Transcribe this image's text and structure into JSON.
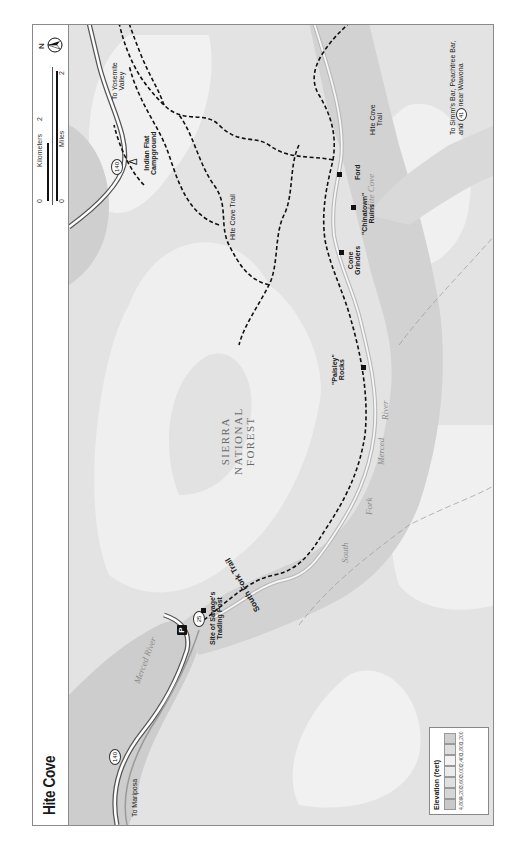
{
  "title": "Hite Cove",
  "orientation": "rotated 90° counter-clockwise",
  "scale": {
    "kilometers_label": "Kilometers",
    "km_start": "0",
    "km_end": "2",
    "miles_label": "Miles",
    "mi_start": "0",
    "mi_end": "2"
  },
  "north_label": "N",
  "legend": {
    "title": "Elevation (feet)",
    "values": [
      "4,800",
      "4,200",
      "3,600",
      "3,000",
      "2,400",
      "1,800",
      "1,200"
    ],
    "colors": [
      "#c9c9c9",
      "#d6d6d6",
      "#e0e0e0",
      "#ebebeb",
      "#f2f2f2",
      "#dedede",
      "#cfcfcf"
    ]
  },
  "labels": {
    "forest": "SIERRA NATIONAL FOREST",
    "forest_line1": "SIERRA",
    "forest_line2": "NATIONAL",
    "forest_line3": "FOREST",
    "to_yosemite": "To Yosemite Valley",
    "to_yosemite_l1": "To Yosemite",
    "to_yosemite_l2": "Valley",
    "indian_flat_l1": "Indian Flat",
    "indian_flat_l2": "Campground",
    "hite_cove_trail_upper": "Hite Cove Trail",
    "hite_cove_water": "Hite Cove",
    "chinatown_l1": "\"Chinatown\"",
    "chinatown_l2": "Ruins",
    "ford": "Ford",
    "cone_l1": "Cone",
    "cone_l2": "Grinders",
    "paisley_l1": "\"Paisley\"",
    "paisley_l2": "Rocks",
    "river_river": "River",
    "river_merced": "Merced",
    "river_fork": "Fork",
    "river_south": "South",
    "merced_river_main": "Merced River",
    "south_fork_trail": "South Fork Trail",
    "savage_l1": "Site of Savage's",
    "savage_l2": "Trading Post",
    "to_mariposa": "To Mariposa",
    "hite_cove_trail_lower_l1": "Hite Cove",
    "hite_cove_trail_lower_l2": "Trail",
    "to_simms_l1": "To Simm's Bar, Peachtree Bar,",
    "to_simms_l2a": "and",
    "to_simms_l2b": "near Wawona"
  },
  "road_shields": {
    "hwy140_a": "140",
    "hwy140_b": "140",
    "hwy41": "41",
    "mile_25": "25"
  },
  "parking_label": "P",
  "campground_symbol": "Δ"
}
